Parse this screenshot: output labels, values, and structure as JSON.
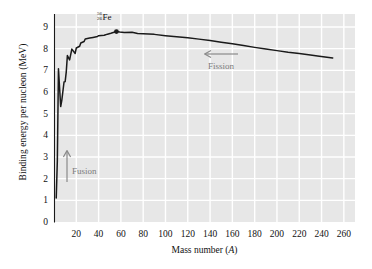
{
  "chart_data": {
    "type": "line",
    "title": "",
    "xlabel": "Mass number (A)",
    "ylabel": "Binding energy per nucleon (MeV)",
    "xlim": [
      0,
      270
    ],
    "ylim": [
      0,
      9.6
    ],
    "grid": true,
    "legend": null,
    "xticks": [
      20,
      40,
      60,
      80,
      100,
      120,
      140,
      160,
      180,
      200,
      220,
      240,
      260
    ],
    "yticks": [
      0,
      1,
      2,
      3,
      4,
      5,
      6,
      7,
      8,
      9
    ],
    "series": [
      {
        "name": "Binding energy per nucleon",
        "x": [
          2,
          3,
          4,
          6,
          7,
          9,
          10,
          11,
          12,
          14,
          16,
          19,
          20,
          23,
          24,
          27,
          28,
          32,
          35,
          39,
          40,
          45,
          48,
          51,
          56,
          59,
          63,
          70,
          75,
          80,
          90,
          100,
          110,
          120,
          130,
          140,
          150,
          160,
          170,
          180,
          190,
          200,
          210,
          220,
          230,
          238,
          250
        ],
        "y": [
          1.11,
          2.83,
          7.07,
          5.33,
          5.61,
          6.46,
          6.48,
          6.93,
          7.68,
          7.48,
          7.98,
          7.78,
          8.03,
          8.11,
          8.26,
          8.33,
          8.45,
          8.49,
          8.52,
          8.56,
          8.6,
          8.62,
          8.67,
          8.71,
          8.79,
          8.77,
          8.75,
          8.76,
          8.7,
          8.69,
          8.66,
          8.6,
          8.55,
          8.5,
          8.44,
          8.38,
          8.3,
          8.23,
          8.15,
          8.06,
          7.98,
          7.91,
          7.83,
          7.78,
          7.71,
          7.65,
          7.57
        ]
      }
    ],
    "markers": [
      {
        "name": "iron-56",
        "x": 56,
        "y": 8.79,
        "label_mass": "56",
        "label_z": "26",
        "label_symbol": "Fe"
      }
    ],
    "annotations": [
      {
        "name": "fusion",
        "text": "Fusion",
        "arrow": "up"
      },
      {
        "name": "fission",
        "text": "Fission",
        "arrow": "left"
      }
    ],
    "colors": {
      "plot_background": "#e7e7e7",
      "gridline": "#ffffff",
      "curve": "#1a1a1a",
      "annotation": "#7c7c7c",
      "axis": "#1a1a1a"
    }
  }
}
